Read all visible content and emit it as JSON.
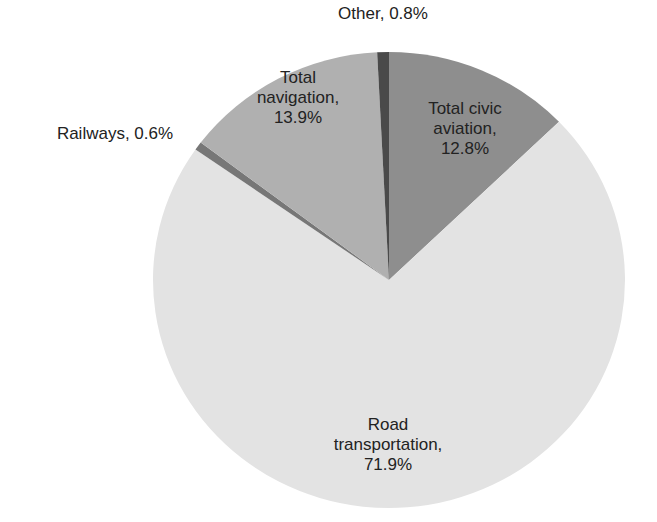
{
  "chart_data": {
    "type": "pie",
    "title": "",
    "start_angle_deg": 0,
    "direction": "clockwise",
    "slices": [
      {
        "label": "Total civic aviation",
        "value": 12.8,
        "color": "#8e8e8e",
        "text_lines": [
          "Total civic",
          "aviation,",
          "12.8%"
        ]
      },
      {
        "label": "Road transportation",
        "value": 71.9,
        "color": "#e3e3e3",
        "text_lines": [
          "Road",
          "transportation,",
          "71.9%"
        ]
      },
      {
        "label": "Railways",
        "value": 0.6,
        "color": "#777777",
        "text_lines": [
          "Railways, 0.6%"
        ]
      },
      {
        "label": "Total navigation",
        "value": 13.9,
        "color": "#b0b0b0",
        "text_lines": [
          "Total",
          "navigation,",
          "13.9%"
        ]
      },
      {
        "label": "Other",
        "value": 0.8,
        "color": "#4a4a4a",
        "text_lines": [
          "Other, 0.8%"
        ]
      }
    ],
    "legend": "none",
    "units": "%"
  },
  "labels": {
    "aviation": {
      "l1": "Total civic",
      "l2": "aviation,",
      "l3": "12.8%"
    },
    "road": {
      "l1": "Road",
      "l2": "transportation,",
      "l3": "71.9%"
    },
    "railways": {
      "l1": "Railways, 0.6%"
    },
    "navigation": {
      "l1": "Total",
      "l2": "navigation,",
      "l3": "13.9%"
    },
    "other": {
      "l1": "Other, 0.8%"
    }
  }
}
